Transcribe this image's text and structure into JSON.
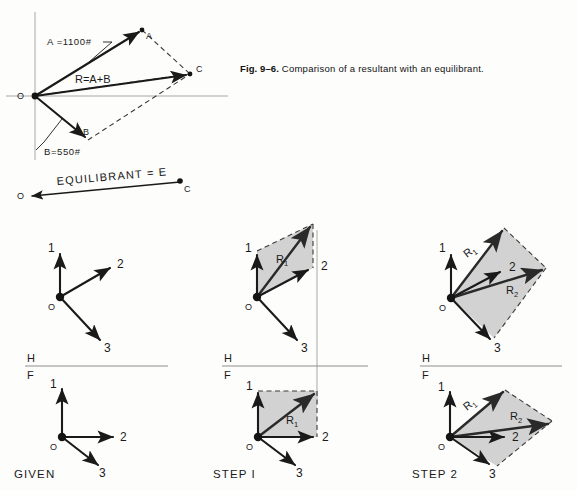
{
  "figure": {
    "number": "Fig. 9–6.",
    "caption": "Comparison of a resultant with an equilibrant."
  },
  "top_diagram": {
    "name": "resultant-equilibrant-parallelogram",
    "points": {
      "origin": "O",
      "a_tip": "A",
      "b_tip": "B",
      "c_tip": "C"
    },
    "vectors": [
      {
        "id": "A",
        "label": "A",
        "magnitude_label": "A =1100#",
        "magnitude": 1100,
        "unit": "#"
      },
      {
        "id": "B",
        "label": "B",
        "magnitude_label": "B=550#",
        "magnitude": 550,
        "unit": "#"
      },
      {
        "id": "R",
        "label": "R=A+B"
      }
    ],
    "equilibrant": {
      "label": "EQUILIBRANT = E",
      "from_point": "C",
      "to_point": "O"
    }
  },
  "panels": [
    {
      "id": "given",
      "label": "GIVEN",
      "reference_line": {
        "upper": "H",
        "lower": "F"
      },
      "views": [
        {
          "name": "top-view",
          "origin_label": "O",
          "vectors": [
            {
              "label": "1",
              "direction": "up"
            },
            {
              "label": "2",
              "direction": "up-right"
            },
            {
              "label": "3",
              "direction": "down-right"
            }
          ],
          "resultants": []
        },
        {
          "name": "front-view",
          "origin_label": "O",
          "vectors": [
            {
              "label": "1",
              "direction": "up"
            },
            {
              "label": "2",
              "direction": "right"
            },
            {
              "label": "3",
              "direction": "down-right"
            }
          ],
          "resultants": []
        }
      ]
    },
    {
      "id": "step-1",
      "label": "STEP I",
      "reference_line": {
        "upper": "H",
        "lower": "F"
      },
      "views": [
        {
          "name": "top-view",
          "origin_label": "O",
          "vectors": [
            {
              "label": "1",
              "direction": "up"
            },
            {
              "label": "2",
              "direction": "up-right"
            },
            {
              "label": "3",
              "direction": "down-right"
            }
          ],
          "resultants": [
            {
              "label": "R",
              "subscript": "1",
              "of": "1+2"
            }
          ]
        },
        {
          "name": "front-view",
          "origin_label": "O",
          "vectors": [
            {
              "label": "1",
              "direction": "up"
            },
            {
              "label": "2",
              "direction": "right"
            },
            {
              "label": "3",
              "direction": "down-right"
            }
          ],
          "resultants": [
            {
              "label": "R",
              "subscript": "1",
              "of": "1+2"
            }
          ]
        }
      ]
    },
    {
      "id": "step-2",
      "label": "STEP 2",
      "reference_line": {
        "upper": "H",
        "lower": "F"
      },
      "views": [
        {
          "name": "top-view",
          "origin_label": "O",
          "vectors": [
            {
              "label": "1",
              "direction": "up"
            },
            {
              "label": "2",
              "direction": "up-right"
            },
            {
              "label": "3",
              "direction": "down-right"
            }
          ],
          "resultants": [
            {
              "label": "R",
              "subscript": "1",
              "of": "1+2"
            },
            {
              "label": "R",
              "subscript": "2",
              "of": "R1+3"
            }
          ]
        },
        {
          "name": "front-view",
          "origin_label": "O",
          "vectors": [
            {
              "label": "1",
              "direction": "up"
            },
            {
              "label": "2",
              "direction": "right"
            },
            {
              "label": "3",
              "direction": "down-right"
            }
          ],
          "resultants": [
            {
              "label": "R",
              "subscript": "1",
              "of": "1+2"
            },
            {
              "label": "R",
              "subscript": "2",
              "of": "R1+3"
            }
          ]
        }
      ]
    }
  ],
  "colors": {
    "shade": "#d2d2d2",
    "line": "#1a1a1a",
    "axis": "#a8a8a8",
    "background": "#fdfdfb"
  }
}
